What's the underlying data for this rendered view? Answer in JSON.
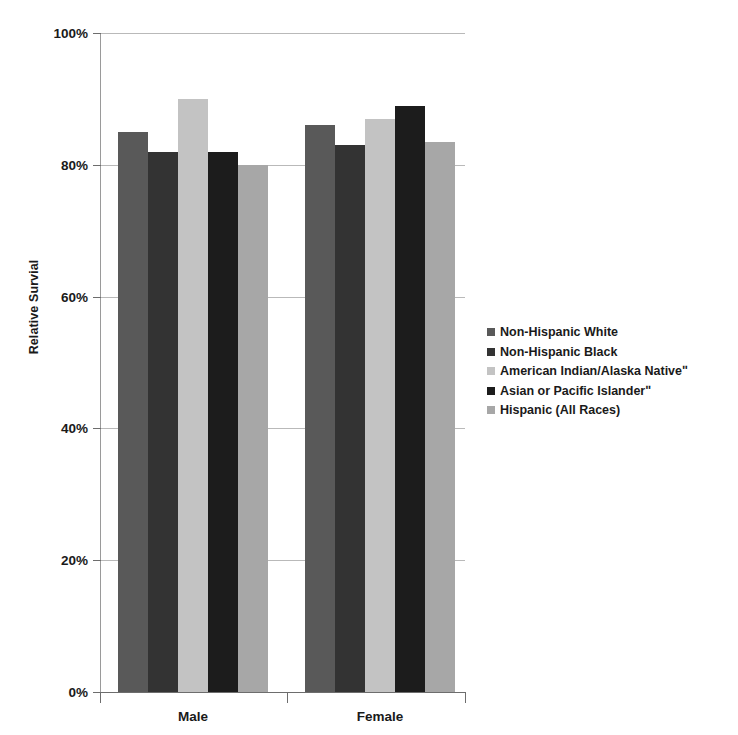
{
  "chart_data": {
    "type": "bar",
    "title": "",
    "xlabel": "",
    "ylabel": "Relative Survial",
    "categories": [
      "Male",
      "Female"
    ],
    "ylim": [
      0,
      100
    ],
    "y_unit": "%",
    "grid": true,
    "legend_position": "right",
    "ytick_labels": [
      "100%",
      "80%",
      "60%",
      "40%",
      "20%",
      "0%"
    ],
    "ytick_values": [
      100,
      80,
      60,
      40,
      20,
      0
    ],
    "series": [
      {
        "name": "Non-Hispanic White",
        "color": "#595959",
        "values": [
          85,
          86
        ]
      },
      {
        "name": "Non-Hispanic Black",
        "color": "#333333",
        "values": [
          82,
          83
        ]
      },
      {
        "name": "American Indian/Alaska Nativeʺ",
        "color": "#c3c3c3",
        "values": [
          90,
          87
        ]
      },
      {
        "name": "Asian or Pacific Islanderʺ",
        "color": "#1c1c1c",
        "values": [
          82,
          89
        ]
      },
      {
        "name": "Hispanic (All Races)",
        "color": "#a7a7a7",
        "values": [
          80,
          83.5
        ]
      }
    ]
  },
  "axis": {
    "y_title": "Relative Survial"
  }
}
